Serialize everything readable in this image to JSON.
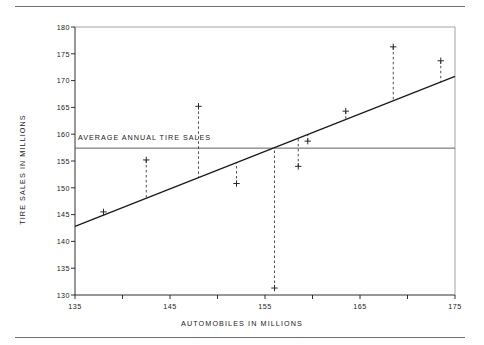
{
  "chart_data": {
    "type": "scatter",
    "title": "",
    "xlabel": "AUTOMOBILES IN MILLIONS",
    "ylabel": "TIRE SALES IN MILLIONS",
    "xlim": [
      135,
      175
    ],
    "ylim": [
      130,
      180
    ],
    "xticks": [
      135,
      140,
      145,
      150,
      155,
      160,
      165,
      170,
      175
    ],
    "xtick_labels": [
      "135",
      "",
      "145",
      "",
      "155",
      "",
      "165",
      "",
      "175"
    ],
    "yticks": [
      130,
      135,
      140,
      145,
      150,
      155,
      160,
      165,
      170,
      175,
      180
    ],
    "ytick_labels": [
      "130",
      "135",
      "140",
      "145",
      "150",
      "155",
      "160",
      "165",
      "170",
      "175",
      "180"
    ],
    "grid": false,
    "legend": null,
    "marker": "plus",
    "points": [
      {
        "x": 138.0,
        "y": 145.5
      },
      {
        "x": 142.5,
        "y": 155.2
      },
      {
        "x": 148.0,
        "y": 165.2
      },
      {
        "x": 152.0,
        "y": 150.8
      },
      {
        "x": 156.0,
        "y": 131.3
      },
      {
        "x": 158.5,
        "y": 154.0
      },
      {
        "x": 159.5,
        "y": 158.7
      },
      {
        "x": 163.5,
        "y": 164.3
      },
      {
        "x": 168.5,
        "y": 176.3
      },
      {
        "x": 173.5,
        "y": 173.7
      }
    ],
    "regression_line": {
      "x_start": 135.0,
      "y_start": 142.8,
      "x_end": 175.0,
      "y_end": 170.8,
      "style": "solid"
    },
    "average_line": {
      "value": 157.4,
      "label": "AVERAGE ANNUAL TIRE SALES",
      "style": "solid"
    },
    "residual_lines": {
      "style": "dashed",
      "description": "vertical dashed segment from each point to the regression line"
    }
  },
  "colors": {
    "axis": "#1a1a1a",
    "data": "#2a2a2a",
    "rule": "#6f6f6f",
    "background": "#ffffff"
  },
  "labels": {
    "x_axis_title": "AUTOMOBILES IN MILLIONS",
    "y_axis_title": "TIRE SALES IN MILLIONS",
    "average_line_label": "AVERAGE ANNUAL TIRE SALES"
  }
}
